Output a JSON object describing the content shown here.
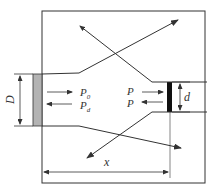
{
  "diagram": {
    "labels": {
      "D": "D",
      "d": "d",
      "x": "x",
      "P0": "P",
      "P0_sub": "0",
      "Pd": "P",
      "Pd_sub": "d",
      "P_fwd": "P",
      "P_back": "P"
    },
    "colors": {
      "line": "#333333",
      "left_port": "#b3b3b3",
      "right_port": "#111111"
    }
  }
}
